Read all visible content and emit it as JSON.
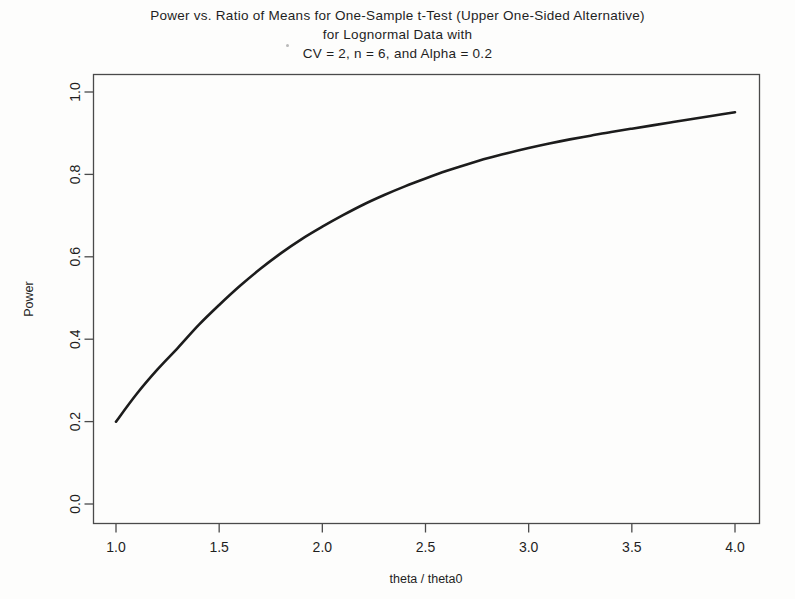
{
  "figure": {
    "background_color": "#fdfdfc",
    "title_lines": [
      "Power vs. Ratio of Means for One-Sample t-Test (Upper One-Sided Alternative)",
      "for Lognormal Data with",
      "CV = 2, n = 6, and Alpha = 0.2"
    ]
  },
  "chart_data": {
    "type": "line",
    "title": "Power vs. Ratio of Means for One-Sample t-Test (Upper One-Sided Alternative) for Lognormal Data with CV = 2, n = 6, and Alpha = 0.2",
    "xlabel": "theta / theta0",
    "ylabel": "Power",
    "xlim": [
      1.0,
      4.0
    ],
    "ylim": [
      0.0,
      1.0
    ],
    "xticks": [
      1.0,
      1.5,
      2.0,
      2.5,
      3.0,
      3.5,
      4.0
    ],
    "xtick_labels": [
      "1.0",
      "1.5",
      "2.0",
      "2.5",
      "3.0",
      "3.5",
      "4.0"
    ],
    "yticks": [
      0.0,
      0.2,
      0.4,
      0.6,
      0.8,
      1.0
    ],
    "ytick_labels": [
      "0.0",
      "0.2",
      "0.4",
      "0.6",
      "0.8",
      "1.0"
    ],
    "grid": false,
    "legend": false,
    "line_color": "#1c1c1c",
    "line_width": 2.6,
    "series": [
      {
        "name": "Power",
        "x": [
          1.0,
          1.1,
          1.2,
          1.3,
          1.4,
          1.5,
          1.6,
          1.7,
          1.8,
          1.9,
          2.0,
          2.1,
          2.2,
          2.3,
          2.4,
          2.5,
          2.6,
          2.7,
          2.8,
          2.9,
          3.0,
          3.1,
          3.2,
          3.3,
          3.4,
          3.5,
          3.6,
          3.7,
          3.8,
          3.9,
          4.0
        ],
        "y": [
          0.2,
          0.267,
          0.326,
          0.379,
          0.434,
          0.483,
          0.529,
          0.571,
          0.609,
          0.643,
          0.673,
          0.701,
          0.727,
          0.75,
          0.771,
          0.79,
          0.808,
          0.824,
          0.839,
          0.852,
          0.864,
          0.875,
          0.885,
          0.894,
          0.903,
          0.911,
          0.919,
          0.927,
          0.935,
          0.943,
          0.951
        ]
      }
    ]
  }
}
